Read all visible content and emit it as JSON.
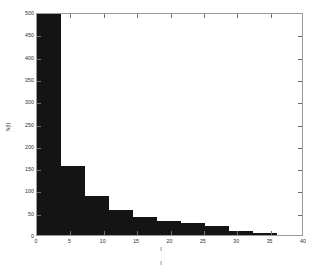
{
  "chart_data": {
    "type": "bar",
    "title": "",
    "xlabel": "l",
    "ylabel": "N(l)",
    "xlim": [
      0,
      40
    ],
    "ylim": [
      0,
      500
    ],
    "xticks": [
      0,
      5,
      10,
      15,
      20,
      25,
      30,
      35,
      40
    ],
    "yticks": [
      0,
      50,
      100,
      150,
      200,
      250,
      300,
      350,
      400,
      450,
      500
    ],
    "grid": false,
    "legend": null,
    "bar_color": "#141414",
    "note_below_axis": "l",
    "bins": [
      {
        "x0": 0.0,
        "x1": 3.6,
        "value": 500
      },
      {
        "x0": 3.6,
        "x1": 7.2,
        "value": 155
      },
      {
        "x0": 7.2,
        "x1": 10.8,
        "value": 88
      },
      {
        "x0": 10.8,
        "x1": 14.4,
        "value": 55
      },
      {
        "x0": 14.4,
        "x1": 18.0,
        "value": 40
      },
      {
        "x0": 18.0,
        "x1": 21.6,
        "value": 32
      },
      {
        "x0": 21.6,
        "x1": 25.2,
        "value": 28
      },
      {
        "x0": 25.2,
        "x1": 28.8,
        "value": 20
      },
      {
        "x0": 28.8,
        "x1": 32.4,
        "value": 10
      },
      {
        "x0": 32.4,
        "x1": 36.0,
        "value": 5
      }
    ],
    "categories": [
      "0-3.6",
      "3.6-7.2",
      "7.2-10.8",
      "10.8-14.4",
      "14.4-18",
      "18-21.6",
      "21.6-25.2",
      "25.2-28.8",
      "28.8-32.4",
      "32.4-36"
    ],
    "values": [
      500,
      155,
      88,
      55,
      40,
      32,
      28,
      20,
      10,
      5
    ]
  }
}
